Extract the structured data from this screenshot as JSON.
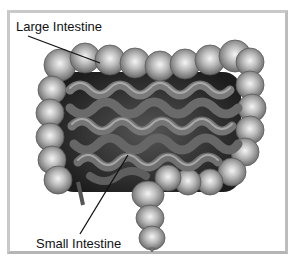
{
  "diagram": {
    "labels": [
      {
        "id": "large",
        "text": "Large Intestine"
      },
      {
        "id": "small",
        "text": "Small Intestine"
      }
    ],
    "colors": {
      "frame": "#c9c9c9",
      "background": "#ffffff",
      "tissue_light": "#d8d8d8",
      "tissue_mid": "#8a8a8a",
      "tissue_dark": "#2a2a2a",
      "line": "#111111"
    }
  }
}
